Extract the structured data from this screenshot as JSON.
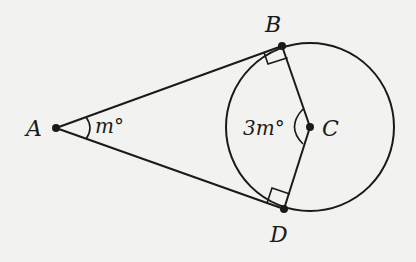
{
  "diagram": {
    "type": "geometry",
    "points": {
      "A": {
        "label": "A",
        "x": 56,
        "y": 128
      },
      "B": {
        "label": "B",
        "x": 282,
        "y": 46
      },
      "C": {
        "label": "C",
        "x": 310,
        "y": 127
      },
      "D": {
        "label": "D",
        "x": 284,
        "y": 209
      }
    },
    "circle": {
      "center": "C",
      "radius": 84
    },
    "angle_labels": {
      "A": "m°",
      "C": "3m°"
    },
    "right_angles": [
      "B",
      "D"
    ],
    "colors": {
      "stroke": "#1a1a1a",
      "background": "#f2f2f0"
    }
  }
}
